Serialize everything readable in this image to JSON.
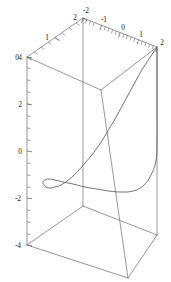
{
  "figure": {
    "kind": "parametric-3d-plot",
    "width": 171,
    "height": 282,
    "background_color": "#ffffff",
    "line_color": "#5a5a5a",
    "frame_color": "#6b6b6b",
    "label_color": "#1a1a1a"
  },
  "chart_data": {
    "type": "line",
    "title": "",
    "subtitle": "",
    "xlabel": "",
    "ylabel": "",
    "zlabel": "",
    "projection": "3d-wireframe-box",
    "grid": false,
    "legend": null,
    "axes": {
      "x": {
        "position": "top-left-edge",
        "lim": [
          0,
          2
        ],
        "ticks": [
          0,
          1,
          2
        ],
        "tick_labels": [
          "0",
          "1",
          "2"
        ],
        "minor_ticks_per_interval": 4
      },
      "y": {
        "position": "top-right-edge",
        "lim": [
          -2,
          2
        ],
        "ticks": [
          -2,
          -1,
          0,
          1,
          2
        ],
        "tick_labels": [
          "-2",
          "-1",
          "0",
          "1",
          "2"
        ],
        "minor_ticks_per_interval": 4
      },
      "z": {
        "position": "left-vertical-edge",
        "lim": [
          -4,
          4
        ],
        "ticks": [
          4,
          2,
          0,
          -2,
          -4
        ],
        "tick_labels": [
          "4",
          "2",
          "0",
          "-2",
          "-4"
        ],
        "minor_ticks_per_interval": 4
      }
    },
    "series": [
      {
        "name": "curve",
        "description": "single 3d parametric curve descending from the upper-right box corner, sweeping left and folding back near z=-2",
        "points_screen": [
          [
            157,
            47
          ],
          [
            151,
            56
          ],
          [
            145,
            65
          ],
          [
            139,
            75
          ],
          [
            133,
            86
          ],
          [
            127,
            97
          ],
          [
            121,
            108
          ],
          [
            115,
            119
          ],
          [
            109,
            129
          ],
          [
            103,
            139
          ],
          [
            97,
            148
          ],
          [
            91,
            156
          ],
          [
            85,
            163
          ],
          [
            79,
            170
          ],
          [
            73,
            176
          ],
          [
            67,
            181
          ],
          [
            61,
            185
          ],
          [
            55,
            187
          ],
          [
            50,
            188
          ],
          [
            46,
            187
          ],
          [
            44,
            185
          ],
          [
            43,
            182
          ],
          [
            45,
            180
          ],
          [
            49,
            179
          ],
          [
            55,
            180
          ],
          [
            63,
            182
          ],
          [
            73,
            184
          ],
          [
            85,
            187
          ],
          [
            97,
            189
          ],
          [
            109,
            191
          ],
          [
            121,
            192
          ],
          [
            133,
            191
          ],
          [
            143,
            186
          ],
          [
            151,
            175
          ],
          [
            156,
            160
          ],
          [
            157,
            140
          ],
          [
            157,
            110
          ],
          [
            157,
            75
          ],
          [
            157,
            48
          ]
        ]
      }
    ]
  },
  "box": {
    "description": "wireframe bounding box corners in screen coordinates",
    "top_face": {
      "left": [
        27,
        57
      ],
      "back": [
        83,
        18
      ],
      "right": [
        157,
        47
      ],
      "front": [
        101,
        90
      ]
    },
    "bottom_face": {
      "left": [
        27,
        245
      ],
      "back": [
        83,
        206
      ],
      "right": [
        157,
        235
      ],
      "front": [
        128,
        278
      ]
    }
  },
  "labels": {
    "x_axis": [
      "0",
      "1",
      "2"
    ],
    "y_axis": [
      "-2",
      "-1",
      "0",
      "1",
      "2"
    ],
    "z_axis": [
      "4",
      "2",
      "0",
      "-2",
      "-4"
    ]
  }
}
